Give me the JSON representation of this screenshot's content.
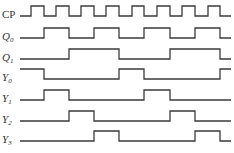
{
  "diagram": {
    "type": "timing",
    "x_start": 20,
    "x_end": 231,
    "transitions_x": [
      31,
      44,
      56,
      69,
      81,
      94,
      106,
      119,
      132,
      144,
      157,
      170,
      182,
      195,
      208,
      220
    ],
    "signals": [
      {
        "id": "CP",
        "label": "CP",
        "sub": "",
        "italic": false,
        "low_y": 16,
        "high_y": 6,
        "initial": 0,
        "edges": [
          31,
          44,
          56,
          69,
          81,
          94,
          106,
          119,
          132,
          144,
          157,
          170,
          182,
          195,
          208,
          220
        ]
      },
      {
        "id": "Q0",
        "label": "Q",
        "sub": "0",
        "italic": true,
        "low_y": 38,
        "high_y": 28,
        "initial": 0,
        "edges": [
          44,
          69,
          94,
          119,
          144,
          170,
          195,
          220
        ]
      },
      {
        "id": "Q1",
        "label": "Q",
        "sub": "1",
        "italic": true,
        "low_y": 59,
        "high_y": 49,
        "initial": 0,
        "edges": [
          69,
          119,
          170,
          220
        ]
      },
      {
        "id": "Y0",
        "label": "Y",
        "sub": "0",
        "italic": true,
        "low_y": 79,
        "high_y": 69,
        "initial": 1,
        "edges": [
          44,
          119,
          144,
          220
        ]
      },
      {
        "id": "Y1",
        "label": "Y",
        "sub": "1",
        "italic": true,
        "low_y": 100,
        "high_y": 90,
        "initial": 0,
        "edges": [
          44,
          69,
          144,
          170
        ]
      },
      {
        "id": "Y2",
        "label": "Y",
        "sub": "2",
        "italic": true,
        "low_y": 121,
        "high_y": 111,
        "initial": 0,
        "edges": [
          69,
          94,
          170,
          195
        ]
      },
      {
        "id": "Y3",
        "label": "Y",
        "sub": "3",
        "italic": true,
        "low_y": 141,
        "high_y": 131,
        "initial": 0,
        "edges": [
          94,
          119,
          195,
          220
        ]
      }
    ],
    "colors": {
      "stroke": "#3a3a3a",
      "text": "#333333",
      "background": "#ffffff"
    }
  }
}
